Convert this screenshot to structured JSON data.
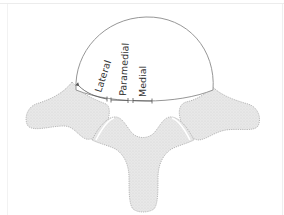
{
  "diagram": {
    "labels": {
      "lateral": "Lateral",
      "paramedial": "Paramedial",
      "medial": "Medial"
    },
    "colors": {
      "disc_fill": "#ffffff",
      "disc_stroke": "#8a8a8a",
      "bone_fill": "#e6e6e6",
      "bone_stroke": "#a8a8a8",
      "label_text": "#333333",
      "marker_stroke": "#555555",
      "frame": "#ececec"
    }
  }
}
